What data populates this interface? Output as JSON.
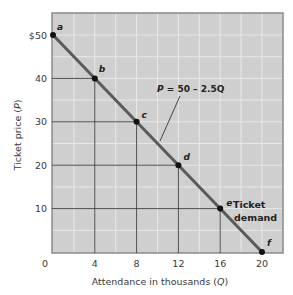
{
  "chart_data": {
    "type": "line",
    "title": "",
    "xlabel": "Attendance in thousands (Q)",
    "ylabel": "Ticket price (P)",
    "xlim": [
      0,
      20
    ],
    "ylim": [
      0,
      50
    ],
    "x_ticks": [
      "0",
      "4",
      "8",
      "12",
      "16",
      "20"
    ],
    "y_ticks": [
      "$50",
      "40",
      "30",
      "20",
      "10"
    ],
    "grid": true,
    "series": [
      {
        "name": "Ticket demand",
        "equation": "P = 50 – 2.5Q",
        "points": [
          {
            "label": "a",
            "x": 0,
            "y": 50
          },
          {
            "label": "b",
            "x": 4,
            "y": 40
          },
          {
            "label": "c",
            "x": 8,
            "y": 30
          },
          {
            "label": "d",
            "x": 12,
            "y": 20
          },
          {
            "label": "e",
            "x": 16,
            "y": 10
          },
          {
            "label": "f",
            "x": 20,
            "y": 0
          }
        ]
      }
    ],
    "annotations": [
      "P = 50 – 2.5Q",
      "Ticket demand"
    ]
  },
  "labels": {
    "x_axis": "Attendance in thousands (Q)",
    "x_axis_prefix": "Attendance in thousands (",
    "x_axis_var": "Q",
    "x_axis_suffix": ")",
    "y_axis_prefix": "Ticket price (",
    "y_axis_var": "P",
    "y_axis_suffix": ")",
    "equation_var": "P",
    "equation_rest": " = 50 – 2.5Q",
    "demand_line1": "Ticket",
    "demand_line2": "demand"
  },
  "colors": {
    "plot_bg": "#cfcfcf",
    "grid": "#e8e8e8",
    "frame": "#8a8a8a",
    "curve": "#5a5a5a",
    "guide": "#3c3c3c",
    "point": "#111111"
  }
}
